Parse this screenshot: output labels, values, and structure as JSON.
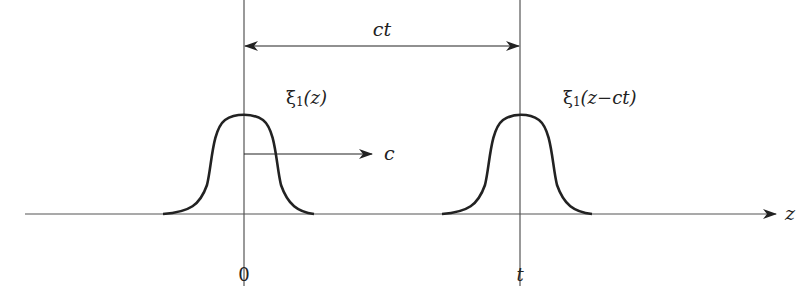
{
  "diagram": {
    "title_label": "ct",
    "pulse_left_label": "ξ₁(z)",
    "pulse_left_label_parts": {
      "sym": "ξ",
      "sub": "1",
      "arg": "(z)"
    },
    "pulse_right_label_parts": {
      "sym": "ξ",
      "sub": "1",
      "arg": "(z−ct)"
    },
    "velocity_label": "c",
    "axis_label": "z",
    "tick_labels": [
      "0",
      "t"
    ],
    "colors": {
      "stroke": "#222222",
      "axis": "#555555",
      "background": "#ffffff"
    }
  }
}
